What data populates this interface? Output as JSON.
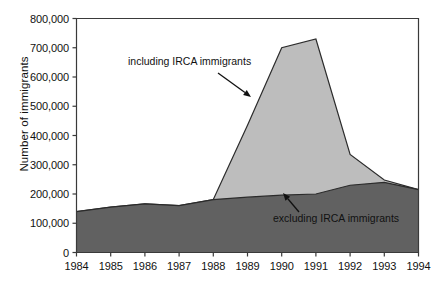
{
  "chart_data": {
    "type": "area",
    "title": "",
    "xlabel": "",
    "ylabel": "Number of immigrants",
    "x": [
      1984,
      1985,
      1986,
      1987,
      1988,
      1989,
      1990,
      1991,
      1992,
      1993,
      1994
    ],
    "xtick_labels": [
      "1984",
      "1985",
      "1986",
      "1987",
      "1988",
      "1989",
      "1990",
      "1991",
      "1992",
      "1993",
      "1994"
    ],
    "ytick_labels": [
      "0",
      "100,000",
      "200,000",
      "300,000",
      "400,000",
      "500,000",
      "600,000",
      "700,000",
      "800,000"
    ],
    "ytick_values": [
      0,
      100000,
      200000,
      300000,
      400000,
      500000,
      600000,
      700000,
      800000
    ],
    "ylim": [
      0,
      800000
    ],
    "xlim": [
      1984,
      1994
    ],
    "grid": false,
    "legend_position": "inline-annotations",
    "series": [
      {
        "name": "including IRCA immigrants",
        "color": "#bdbdbd",
        "values": [
          140000,
          155000,
          166000,
          160000,
          181000,
          435000,
          700000,
          730000,
          335000,
          248000,
          215000
        ]
      },
      {
        "name": "excluding IRCA immigrants",
        "color": "#616161",
        "values": [
          140000,
          155000,
          166000,
          160000,
          181000,
          189000,
          196000,
          200000,
          230000,
          240000,
          215000
        ]
      }
    ],
    "annotations": [
      {
        "label": "including IRCA immigrants",
        "target_x": 1989,
        "target_y": 470000
      },
      {
        "label": "excluding IRCA immigrants",
        "target_x": 1991,
        "target_y": 205000
      }
    ]
  },
  "colors": {
    "including_fill": "#bdbdbd",
    "excluding_fill": "#616161",
    "outline": "#2b2b2b",
    "axis": "#3a3a3a",
    "text": "#111111",
    "background": "#ffffff"
  }
}
